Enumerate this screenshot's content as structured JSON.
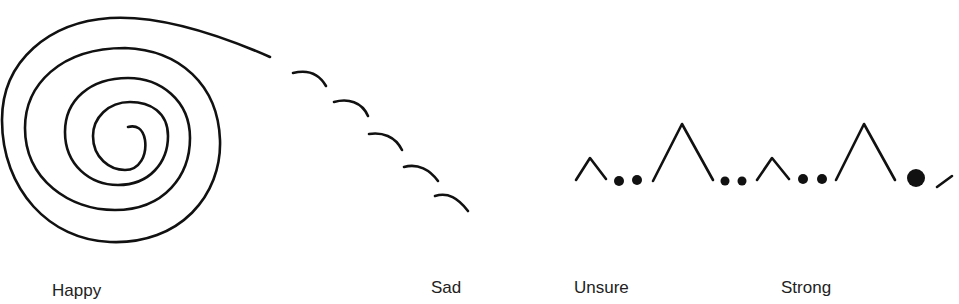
{
  "figure": {
    "panels": [
      {
        "id": "happy",
        "label": "Happy",
        "drawing": "spiral-icon"
      },
      {
        "id": "sad",
        "label": "Sad",
        "drawing": "descending-arcs-icon"
      },
      {
        "id": "unsure",
        "label": "Unsure",
        "drawing": "small-peaks-and-dots-icon"
      },
      {
        "id": "strong",
        "label": "Strong",
        "drawing": "tall-peaks-and-dots-icon"
      }
    ],
    "colors": {
      "ink": "#111111",
      "text": "#222222",
      "background": "#ffffff"
    }
  }
}
